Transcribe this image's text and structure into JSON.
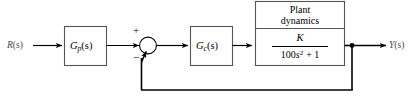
{
  "diagram": {
    "type": "control-system-block-diagram",
    "colors": {
      "line": "#000000",
      "block_stroke": "#555555",
      "background": "#ffffff",
      "signal_label": "#4a4a4a"
    },
    "signals": {
      "input": {
        "base": "R",
        "arg": "(s)",
        "full": "R(s)"
      },
      "output": {
        "base": "Y",
        "arg": "(s)",
        "full": "Y(s)"
      }
    },
    "blocks": [
      {
        "id": "prefilter",
        "name": "prefilter-block",
        "base": "G",
        "subscript": "p",
        "arg": "(s)",
        "full": "Gp(s)"
      },
      {
        "id": "controller",
        "name": "controller-block",
        "base": "G",
        "subscript": "c",
        "arg": "(s)",
        "full": "Gc(s)"
      },
      {
        "id": "plant",
        "name": "plant-block",
        "title_line1": "Plant",
        "title_line2": "dynamics",
        "numerator": "K",
        "denominator_coeff": "100",
        "denominator_var": "s",
        "denominator_exp": "2",
        "denominator_tail": "+ 1",
        "denominator_full": "100s2 + 1",
        "transfer_function": "K / (100s^2 + 1)"
      }
    ],
    "summing_junction": {
      "name": "summing-junction",
      "plus_sign": "+",
      "minus_sign": "−",
      "plus_input": "from prefilter",
      "minus_input": "from feedback path"
    },
    "feedback": {
      "name": "unity-feedback-path",
      "label": ""
    }
  }
}
